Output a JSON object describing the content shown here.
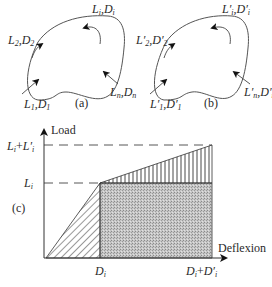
{
  "figure": {
    "panel_a": {
      "label": "(a)",
      "loads": [
        {
          "L": "L",
          "D": "D",
          "sub": "1",
          "prime": false,
          "position": "bottom-left"
        },
        {
          "L": "L",
          "D": "D",
          "sub": "2",
          "prime": false,
          "position": "left"
        },
        {
          "L": "L",
          "D": "D",
          "sub": "i",
          "prime": false,
          "position": "top-right"
        },
        {
          "L": "L",
          "D": "D",
          "sub": "n",
          "prime": false,
          "position": "bottom-right"
        }
      ]
    },
    "panel_b": {
      "label": "(b)",
      "loads": [
        {
          "L": "L",
          "D": "D",
          "sub": "1",
          "prime": true,
          "position": "bottom-left"
        },
        {
          "L": "L",
          "D": "D",
          "sub": "2",
          "prime": true,
          "position": "left"
        },
        {
          "L": "L",
          "D": "D",
          "sub": "i",
          "prime": true,
          "position": "top-right"
        },
        {
          "L": "L",
          "D": "D",
          "sub": "n",
          "prime": true,
          "position": "bottom-right"
        }
      ]
    },
    "panel_c": {
      "label": "(c)",
      "y_axis_label": "Load",
      "x_axis_label": "Deflexion",
      "y_ticks": [
        "L_i",
        "L_i+L'_i"
      ],
      "x_ticks": [
        "D_i",
        "D_i+D'_i"
      ],
      "regions": [
        {
          "name": "initial-triangle",
          "fill": "diagonal-hatch"
        },
        {
          "name": "work-rectangle",
          "fill": "gray-stipple"
        },
        {
          "name": "additional-triangle",
          "fill": "vertical-hatch"
        }
      ]
    }
  },
  "text": {
    "a_label": "(a)",
    "b_label": "(b)",
    "c_label": "(c)",
    "load": "Load",
    "deflexion": "Deflexion",
    "L": "L",
    "D": "D",
    "comma": ",",
    "plus": "+",
    "prime": "′",
    "s1": "1",
    "s2": "2",
    "si": "i",
    "sn": "n"
  },
  "colors": {
    "line": "#3a3a3a",
    "shade": "#bdbdbd"
  }
}
